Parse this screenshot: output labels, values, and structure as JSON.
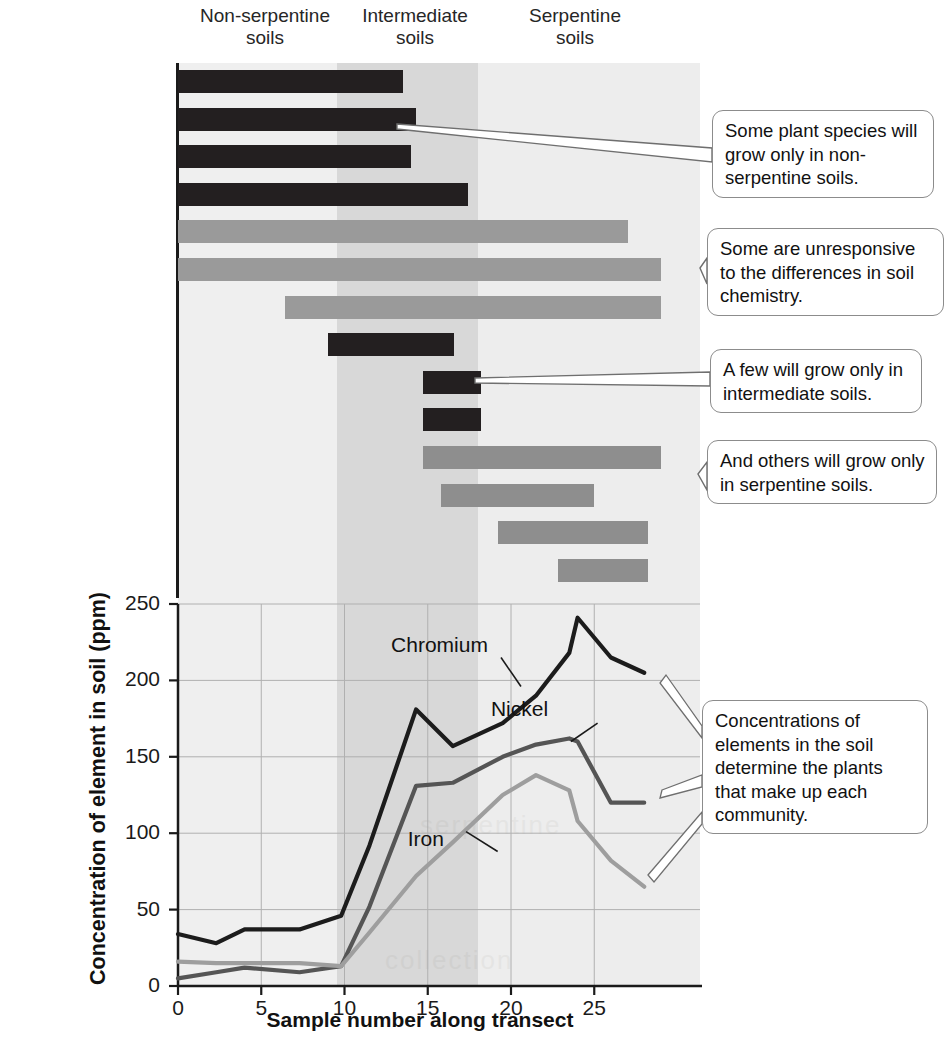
{
  "soil_bands": [
    {
      "name": "non-serpentine",
      "label": "Non-serpentine\nsoils",
      "x_start": 0,
      "x_end": 9,
      "color": "#efefef"
    },
    {
      "name": "intermediate",
      "label": "Intermediate\nsoils",
      "x_start": 9,
      "x_end": 17.5,
      "color": "#d6d6d6"
    },
    {
      "name": "serpentine",
      "label": "Serpentine\nsoils",
      "x_start": 17.5,
      "x_end": 29,
      "color": "#ececec"
    }
  ],
  "species_panel": {
    "species": [
      {
        "name": "Black oak (T)",
        "start": 0,
        "end": 13.5,
        "group": "non-serpentine",
        "color": "#231f20"
      },
      {
        "name": "Poison oak (V)",
        "start": 0,
        "end": 14.3,
        "group": "non-serpentine",
        "color": "#231f20"
      },
      {
        "name": "Iris (H)",
        "start": 0,
        "end": 14.0,
        "group": "non-serpentine",
        "color": "#231f20"
      },
      {
        "name": "Douglas fir (T)",
        "start": 0,
        "end": 17.4,
        "group": "non-serpentine",
        "color": "#231f20"
      },
      {
        "name": "Hawkweed (H)",
        "start": 0,
        "end": 27.0,
        "group": "unresponsive",
        "color": "#9a9a9a"
      },
      {
        "name": "Fescue (H)",
        "start": 0,
        "end": 29.0,
        "group": "unresponsive",
        "color": "#9a9a9a"
      },
      {
        "name": "Snakeroot (H)",
        "start": 6.4,
        "end": 29.0,
        "group": "unresponsive",
        "color": "#9a9a9a"
      },
      {
        "name": "Canyon live oak (T)",
        "start": 9.0,
        "end": 16.6,
        "group": "intermediate",
        "color": "#231f20"
      },
      {
        "name": "Collomia (H)",
        "start": 14.7,
        "end": 18.2,
        "group": "intermediate",
        "color": "#231f20"
      },
      {
        "name": "Ragwort (H)",
        "start": 14.7,
        "end": 18.2,
        "group": "intermediate",
        "color": "#231f20"
      },
      {
        "name": "Yarrow (H)",
        "start": 14.7,
        "end": 29.0,
        "group": "serpentine",
        "color": "#8e8e8e"
      },
      {
        "name": "Buck brush (S)",
        "start": 15.8,
        "end": 25.0,
        "group": "serpentine",
        "color": "#8e8e8e"
      },
      {
        "name": "Fireweed (H)",
        "start": 19.2,
        "end": 28.2,
        "group": "serpentine",
        "color": "#8e8e8e"
      },
      {
        "name": "Knotweed (H)",
        "start": 22.8,
        "end": 28.2,
        "group": "serpentine",
        "color": "#8e8e8e"
      }
    ]
  },
  "callouts": [
    {
      "id": "callout-non-serpentine",
      "text": "Some plant species will grow only in non-serpentine soils."
    },
    {
      "id": "callout-unresponsive",
      "text": "Some are unresponsive to the differences in soil chemistry."
    },
    {
      "id": "callout-intermediate",
      "text": "A few will grow only in intermediate soils."
    },
    {
      "id": "callout-serpentine",
      "text": "And others will grow only in serpentine soils."
    },
    {
      "id": "callout-concentrations",
      "text": "Concentrations of elements in the soil determine the plants that make up each community."
    }
  ],
  "chart_data": {
    "type": "line",
    "title": "",
    "xlabel": "Sample number along transect",
    "ylabel": "Concentration of element in soil (ppm)",
    "xlim": [
      0,
      29
    ],
    "ylim": [
      0,
      250
    ],
    "xticks": [
      0,
      5,
      10,
      15,
      20,
      25
    ],
    "yticks": [
      0,
      50,
      100,
      150,
      200,
      250
    ],
    "grid": true,
    "legend_position": "inline-annotations",
    "x": [
      0,
      2.3,
      4,
      7.3,
      9.8,
      11.5,
      14.3,
      16.5,
      19.5,
      21.5,
      23.5,
      24,
      26,
      28
    ],
    "series": [
      {
        "name": "Chromium",
        "color": "#1c1c1c",
        "values": [
          34,
          28,
          37,
          37,
          46,
          92,
          181,
          157,
          172,
          190,
          218,
          241,
          215,
          205
        ]
      },
      {
        "name": "Nickel",
        "color": "#555555",
        "values": [
          5,
          9,
          12,
          9,
          13,
          52,
          131,
          133,
          150,
          158,
          162,
          160,
          120,
          120
        ]
      },
      {
        "name": "Iron",
        "color": "#9e9e9e",
        "values": [
          16,
          15,
          15,
          15,
          13,
          35,
          72,
          94,
          125,
          138,
          128,
          108,
          82,
          65
        ]
      }
    ],
    "annotations": [
      {
        "text": "Chromium",
        "x": 17.0,
        "y": 222
      },
      {
        "text": "Nickel",
        "x": 23.0,
        "y": 180
      },
      {
        "text": "Iron",
        "x": 18.0,
        "y": 95
      }
    ]
  }
}
